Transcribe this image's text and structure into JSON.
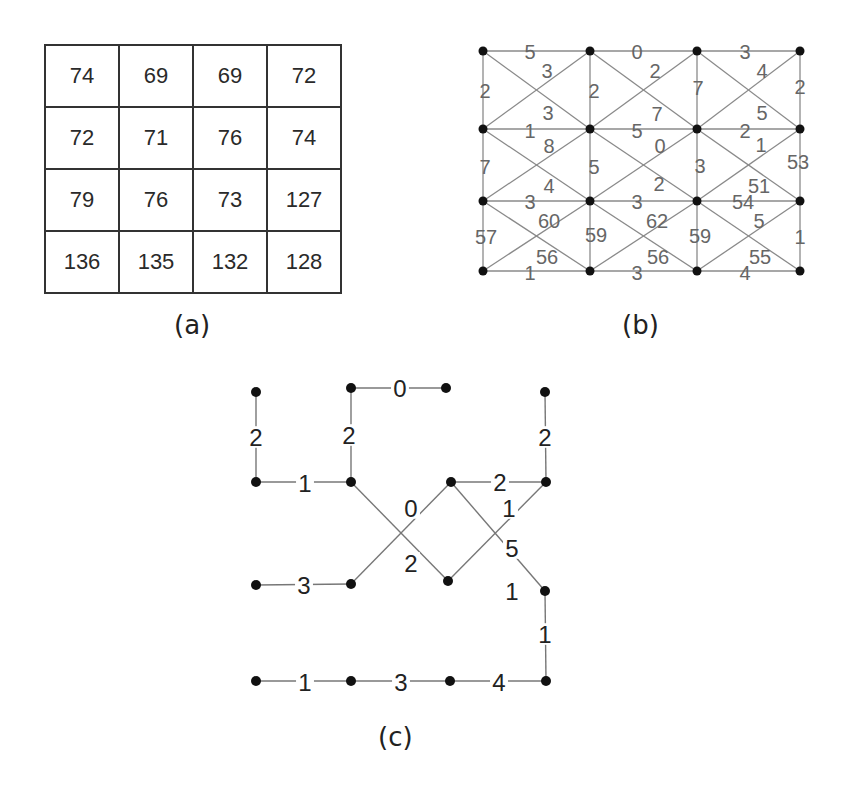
{
  "figure": {
    "panels": [
      {
        "id": "a",
        "caption": "(a)"
      },
      {
        "id": "b",
        "caption": "(b)"
      },
      {
        "id": "c",
        "caption": "(c)"
      }
    ]
  },
  "panel_a": {
    "caption": "(a)",
    "grid": [
      [
        "74",
        "69",
        "69",
        "72"
      ],
      [
        "72",
        "71",
        "76",
        "74"
      ],
      [
        "79",
        "76",
        "73",
        "127"
      ],
      [
        "136",
        "135",
        "132",
        "128"
      ]
    ]
  },
  "panel_b": {
    "caption": "(b)",
    "style": {
      "line_color": "#8a8a8a",
      "label_color": "#666666",
      "node_color": "#111111"
    },
    "nodes": [
      [
        483,
        51
      ],
      [
        590,
        51
      ],
      [
        697,
        51
      ],
      [
        800,
        51
      ],
      [
        483,
        129
      ],
      [
        590,
        129
      ],
      [
        697,
        129
      ],
      [
        800,
        129
      ],
      [
        483,
        201
      ],
      [
        590,
        201
      ],
      [
        697,
        201
      ],
      [
        800,
        201
      ],
      [
        483,
        271
      ],
      [
        590,
        271
      ],
      [
        697,
        271
      ],
      [
        800,
        271
      ]
    ],
    "edges": [
      {
        "a": 0,
        "b": 1,
        "w": "5",
        "lx": 530,
        "ly": 52
      },
      {
        "a": 1,
        "b": 2,
        "w": "0",
        "lx": 637,
        "ly": 52
      },
      {
        "a": 2,
        "b": 3,
        "w": "3",
        "lx": 745,
        "ly": 52
      },
      {
        "a": 4,
        "b": 5,
        "w": "1",
        "lx": 530,
        "ly": 131
      },
      {
        "a": 5,
        "b": 6,
        "w": "5",
        "lx": 637,
        "ly": 131
      },
      {
        "a": 6,
        "b": 7,
        "w": "2",
        "lx": 745,
        "ly": 131
      },
      {
        "a": 8,
        "b": 9,
        "w": "3",
        "lx": 530,
        "ly": 202
      },
      {
        "a": 9,
        "b": 10,
        "w": "3",
        "lx": 637,
        "ly": 202
      },
      {
        "a": 10,
        "b": 11,
        "w": "54",
        "lx": 743,
        "ly": 202
      },
      {
        "a": 12,
        "b": 13,
        "w": "1",
        "lx": 530,
        "ly": 273
      },
      {
        "a": 13,
        "b": 14,
        "w": "3",
        "lx": 637,
        "ly": 273
      },
      {
        "a": 14,
        "b": 15,
        "w": "4",
        "lx": 745,
        "ly": 273
      },
      {
        "a": 0,
        "b": 4,
        "w": "2",
        "lx": 485,
        "ly": 91
      },
      {
        "a": 1,
        "b": 5,
        "w": "2",
        "lx": 594,
        "ly": 91
      },
      {
        "a": 2,
        "b": 6,
        "w": "7",
        "lx": 698,
        "ly": 88
      },
      {
        "a": 3,
        "b": 7,
        "w": "2",
        "lx": 800,
        "ly": 87
      },
      {
        "a": 4,
        "b": 8,
        "w": "7",
        "lx": 485,
        "ly": 167
      },
      {
        "a": 5,
        "b": 9,
        "w": "5",
        "lx": 594,
        "ly": 167
      },
      {
        "a": 6,
        "b": 10,
        "w": "3",
        "lx": 700,
        "ly": 166
      },
      {
        "a": 7,
        "b": 11,
        "w": "53",
        "lx": 798,
        "ly": 162
      },
      {
        "a": 8,
        "b": 12,
        "w": "57",
        "lx": 486,
        "ly": 237
      },
      {
        "a": 9,
        "b": 13,
        "w": "59",
        "lx": 596,
        "ly": 235
      },
      {
        "a": 10,
        "b": 14,
        "w": "59",
        "lx": 700,
        "ly": 236
      },
      {
        "a": 11,
        "b": 15,
        "w": "1",
        "lx": 800,
        "ly": 237
      },
      {
        "a": 0,
        "b": 5,
        "w": "3",
        "lx": 547,
        "ly": 71
      },
      {
        "a": 1,
        "b": 4,
        "w": "3",
        "lx": 548,
        "ly": 113
      },
      {
        "a": 1,
        "b": 6,
        "w": "2",
        "lx": 655,
        "ly": 71
      },
      {
        "a": 2,
        "b": 5,
        "w": "7",
        "lx": 657,
        "ly": 114
      },
      {
        "a": 2,
        "b": 7,
        "w": "5",
        "lx": 762,
        "ly": 113
      },
      {
        "a": 3,
        "b": 6,
        "w": "4",
        "lx": 762,
        "ly": 71
      },
      {
        "a": 4,
        "b": 9,
        "w": "8",
        "lx": 549,
        "ly": 146
      },
      {
        "a": 5,
        "b": 8,
        "w": "4",
        "lx": 549,
        "ly": 186
      },
      {
        "a": 5,
        "b": 10,
        "w": "0",
        "lx": 660,
        "ly": 146
      },
      {
        "a": 6,
        "b": 9,
        "w": "2",
        "lx": 659,
        "ly": 184
      },
      {
        "a": 6,
        "b": 11,
        "w": "1",
        "lx": 761,
        "ly": 145
      },
      {
        "a": 7,
        "b": 10,
        "w": "51",
        "lx": 759,
        "ly": 186
      },
      {
        "a": 8,
        "b": 13,
        "w": "56",
        "lx": 547,
        "ly": 257
      },
      {
        "a": 9,
        "b": 12,
        "w": "60",
        "lx": 549,
        "ly": 221
      },
      {
        "a": 9,
        "b": 14,
        "w": "56",
        "lx": 658,
        "ly": 257
      },
      {
        "a": 10,
        "b": 13,
        "w": "62",
        "lx": 657,
        "ly": 221
      },
      {
        "a": 10,
        "b": 15,
        "w": "55",
        "lx": 760,
        "ly": 257
      },
      {
        "a": 11,
        "b": 14,
        "w": "5",
        "lx": 759,
        "ly": 221
      }
    ]
  },
  "panel_c": {
    "caption": "(c)",
    "style": {
      "line_color": "#777777",
      "label_color": "#222222",
      "node_color": "#111111"
    },
    "nodes": [
      [
        256,
        392
      ],
      [
        351,
        388
      ],
      [
        446,
        388
      ],
      [
        545,
        392
      ],
      [
        256,
        482
      ],
      [
        351,
        482
      ],
      [
        451,
        482
      ],
      [
        546,
        482
      ],
      [
        256,
        585
      ],
      [
        351,
        584
      ],
      [
        448,
        581
      ],
      [
        545,
        591
      ],
      [
        256,
        681
      ],
      [
        351,
        681
      ],
      [
        450,
        681
      ],
      [
        546,
        681
      ]
    ],
    "edges": [
      {
        "a": 0,
        "b": 4,
        "w": "2",
        "lx": 256,
        "ly": 437
      },
      {
        "a": 1,
        "b": 2,
        "w": "0",
        "lx": 400,
        "ly": 388
      },
      {
        "a": 1,
        "b": 5,
        "w": "2",
        "lx": 349,
        "ly": 435
      },
      {
        "a": 3,
        "b": 7,
        "w": "2",
        "lx": 545,
        "ly": 437
      },
      {
        "a": 4,
        "b": 5,
        "w": "1",
        "lx": 305,
        "ly": 483
      },
      {
        "a": 6,
        "b": 7,
        "w": "2",
        "lx": 500,
        "ly": 482
      },
      {
        "a": 5,
        "b": 10,
        "w": "2",
        "lx": 411,
        "ly": 563
      },
      {
        "a": 9,
        "b": 6,
        "w": "0",
        "lx": 411,
        "ly": 508
      },
      {
        "a": 6,
        "b": 11,
        "w": "5",
        "lx": 512,
        "ly": 548
      },
      {
        "a": 10,
        "b": 7,
        "w": "1",
        "lx": 509,
        "ly": 508
      },
      {
        "a": 8,
        "b": 9,
        "w": "3",
        "lx": 304,
        "ly": 585
      },
      {
        "a": 11,
        "b": 15,
        "w": "1",
        "lx": 545,
        "ly": 634
      },
      {
        "a": 12,
        "b": 13,
        "w": "1",
        "lx": 305,
        "ly": 682
      },
      {
        "a": 13,
        "b": 14,
        "w": "3",
        "lx": 401,
        "ly": 682
      },
      {
        "a": 14,
        "b": 15,
        "w": "4",
        "lx": 499,
        "ly": 682
      }
    ],
    "extra_labels": [
      {
        "w": "1",
        "lx": 512,
        "ly": 591
      }
    ]
  }
}
